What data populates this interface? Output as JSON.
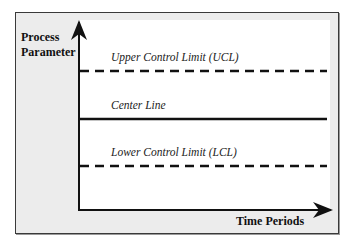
{
  "diagram": {
    "y_axis_label": "Process Parameter",
    "y_axis_label_lines": [
      "Process",
      "Parameter"
    ],
    "x_axis_label": "Time Periods",
    "lines": [
      {
        "name": "ucl",
        "label": "Upper Control Limit (UCL)",
        "style": "dashed",
        "y": 71
      },
      {
        "name": "center",
        "label": "Center Line",
        "style": "solid",
        "y": 119
      },
      {
        "name": "lcl",
        "label": "Lower Control Limit (LCL)",
        "style": "dashed",
        "y": 166
      }
    ],
    "colors": {
      "frame_bg": "#ececec",
      "panel_bg": "#ffffff",
      "line": "#111111"
    }
  }
}
